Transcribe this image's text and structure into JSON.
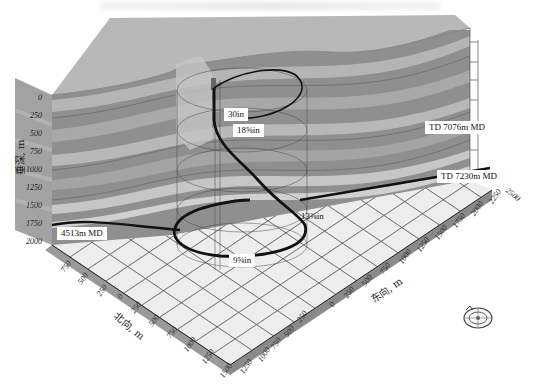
{
  "figure": {
    "type": "3d-well-trajectory"
  },
  "axes": {
    "depth": {
      "title": "垂深, m",
      "ticks": [
        "0",
        "250",
        "500",
        "750",
        "1000",
        "1250",
        "1500",
        "1750",
        "2000"
      ]
    },
    "north": {
      "title": "北向, m",
      "ticks": [
        "750",
        "500",
        "250",
        "0",
        "250",
        "500",
        "750",
        "1000",
        "1250",
        "1500"
      ]
    },
    "east": {
      "title": "东向, m",
      "ticks": [
        "1250",
        "1000",
        "750",
        "500",
        "250",
        "0",
        "250",
        "500",
        "750",
        "1000",
        "1250",
        "1500",
        "1750",
        "2000",
        "2250",
        "2500"
      ]
    }
  },
  "annotations": {
    "casing_30": "30in",
    "casing_18": "18⅝in",
    "casing_13": "13⅜in",
    "casing_9": "9⅝in",
    "td_7076": "TD 7076m MD",
    "td_7230": "TD 7230m MD",
    "md_4513": "4513m MD"
  },
  "colors": {
    "top_surface": "#b9b9b9",
    "strata_dark": "#8d8d8d",
    "strata_mid": "#a6a6a6",
    "strata_light": "#c4c4c4",
    "grid_floor": "#ececec",
    "grid_line": "#555555",
    "trajectory": "#111111",
    "side_wall": "#9b9b9b"
  },
  "compass": {
    "icon": "compass-rose-icon"
  }
}
